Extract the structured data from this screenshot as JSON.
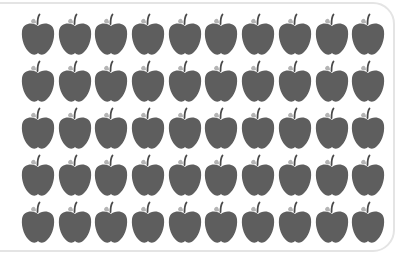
{
  "figure": {
    "rows": 5,
    "columns": 10,
    "total_count": 50,
    "icon": "apple-icon",
    "colors": {
      "apple_body": "#5e5e5e",
      "leaf": "#b4b4b4",
      "stem": "#4a4a4a",
      "frame_border": "#e4e4e4",
      "background": "#ffffff"
    }
  }
}
